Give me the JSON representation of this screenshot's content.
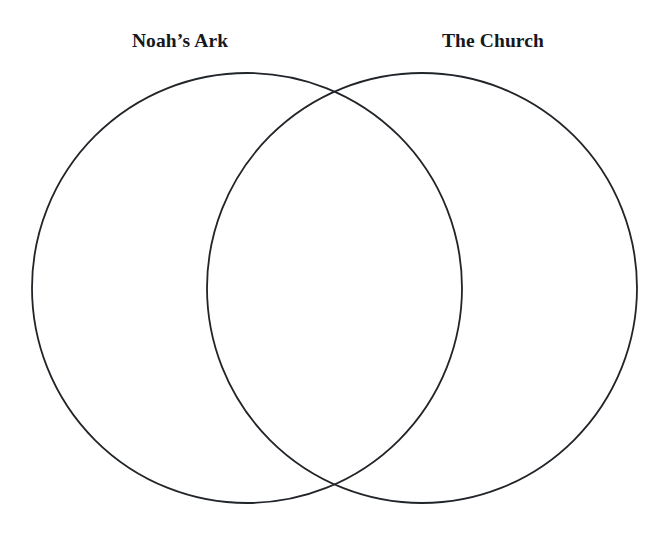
{
  "figure": {
    "type": "venn-diagram",
    "title": "",
    "background_color": "#ffffff",
    "width": 668,
    "height": 538
  },
  "labels": {
    "left": "Noah’s Ark",
    "right": "The Church"
  },
  "sets": [
    {
      "id": "left",
      "name": "Noah’s Ark",
      "center_x": 247,
      "center_y": 288,
      "radius": 215,
      "fill": "none",
      "stroke_color": "#212529",
      "stroke_width": 1.8
    },
    {
      "id": "right",
      "name": "The Church",
      "center_x": 422,
      "center_y": 288,
      "radius": 215,
      "fill": "none",
      "stroke_color": "#212529",
      "stroke_width": 1.8
    }
  ],
  "regions": {
    "left_only": "",
    "intersection": "",
    "right_only": ""
  },
  "style": {
    "stroke_color": "#212529",
    "stroke_width": 1.8,
    "label_color": "#16181c",
    "label_font_size": "19.5px"
  }
}
